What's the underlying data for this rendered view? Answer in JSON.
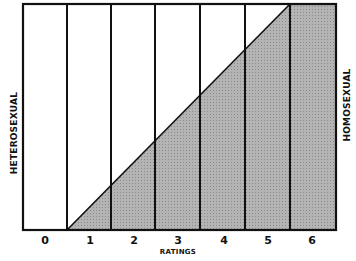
{
  "diagram": {
    "type": "kinsey-scale",
    "left_label": "HETEROSEXUAL",
    "right_label": "HOMOSEXUAL",
    "x_label": "RATINGS",
    "ticks": [
      "0",
      "1",
      "2",
      "3",
      "4",
      "5",
      "6"
    ],
    "colors": {
      "line": "#111111",
      "shaded": "#a8a8a8",
      "background": "#ffffff"
    }
  }
}
